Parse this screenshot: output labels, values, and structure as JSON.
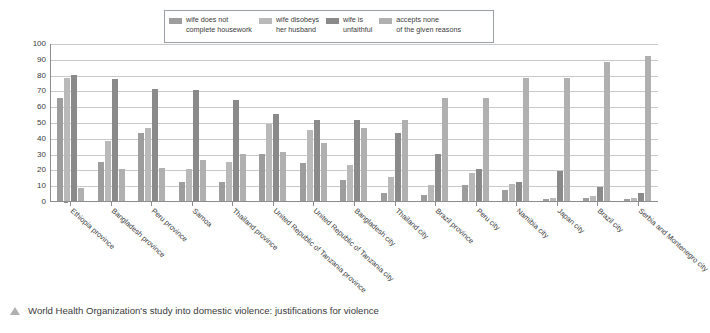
{
  "chart_data": {
    "type": "bar",
    "title": "",
    "xlabel": "",
    "ylabel": "Percentage",
    "ylim": [
      0,
      100
    ],
    "yticks": [
      0,
      10,
      20,
      30,
      40,
      50,
      60,
      70,
      80,
      90,
      100
    ],
    "grid": true,
    "legend_position": "top-center",
    "categories": [
      "Ethiopia province",
      "Bangladesh province",
      "Peru province",
      "Samoa",
      "Thailand province",
      "United Republic of Tanzania province",
      "United Republic of Tanzania city",
      "Bangladesh city",
      "Thailand city",
      "Brazil province",
      "Peru city",
      "Namibia city",
      "Japan city",
      "Brazil city",
      "Serbia and Montenegro city"
    ],
    "series": [
      {
        "name": "wife does not complete housework",
        "color": "#9d9d9d",
        "values": [
          65,
          25,
          43,
          12,
          12,
          30,
          24,
          13,
          5,
          4,
          10,
          7,
          1,
          2,
          1
        ]
      },
      {
        "name": "wife disobeys her husband",
        "color": "#b9b9b9",
        "values": [
          78,
          38,
          46,
          20,
          25,
          49,
          45,
          23,
          15,
          10,
          18,
          11,
          2,
          3,
          2
        ]
      },
      {
        "name": "wife is unfaithful",
        "color": "#8a8a8a",
        "values": [
          80,
          77,
          71,
          70,
          64,
          55,
          51,
          51,
          43,
          30,
          20,
          12,
          19,
          9,
          5
        ]
      },
      {
        "name": "accepts none of the given reasons",
        "color": "#b0b0b0",
        "values": [
          8,
          20,
          21,
          26,
          30,
          31,
          37,
          46,
          51,
          65,
          65,
          78,
          78,
          88,
          92
        ]
      }
    ]
  },
  "legend": {
    "items": [
      {
        "label": "wife does not\ncomplete housework",
        "color": "#9d9d9d"
      },
      {
        "label": "wife disobeys\nher husband",
        "color": "#b9b9b9"
      },
      {
        "label": "wife is\nunfaithful",
        "color": "#8a8a8a"
      },
      {
        "label": "accepts none\nof the given reasons",
        "color": "#b0b0b0"
      }
    ]
  },
  "caption": {
    "marker": "triangle-up-icon",
    "text": "World Health Organization's study into domestic violence: justifications for violence"
  },
  "colors": {
    "axis": "#8d8d8d",
    "gridline": "#c9c9c9",
    "text": "#3b3b3b",
    "background": "#ffffff"
  }
}
